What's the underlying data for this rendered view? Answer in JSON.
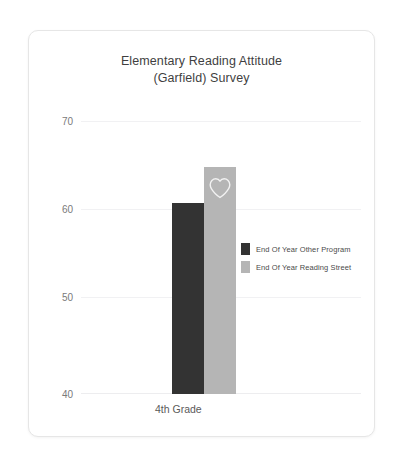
{
  "card": {
    "title_line1": "Elementary Reading Attitude",
    "title_line2": "(Garfield) Survey"
  },
  "colors": {
    "series_other_program": "#333333",
    "series_reading_street": "#b5b5b5",
    "gridline": "#f1f1f3",
    "tick_text": "#7a7a7a",
    "title_text": "#3f3f3f",
    "card_border": "#e6e6e6"
  },
  "icons": {
    "heart": "heart-icon"
  },
  "chart_data": {
    "type": "bar",
    "title": "Elementary Reading Attitude (Garfield) Survey",
    "xlabel": "",
    "ylabel": "",
    "categories": [
      "4th Grade"
    ],
    "series": [
      {
        "name": "End Of Year Other Program",
        "color": "#333333",
        "values": [
          61
        ]
      },
      {
        "name": "End Of Year Reading Street",
        "color": "#b5b5b5",
        "values": [
          65
        ]
      }
    ],
    "ylim": [
      40,
      70
    ],
    "yticks": [
      40,
      50,
      60,
      70
    ],
    "ytick_labels": [
      "40",
      "50",
      "60",
      "70"
    ],
    "grid": true,
    "legend_position": "center-right"
  },
  "yaxis": {
    "ticks": [
      {
        "label": "70",
        "value": 70
      },
      {
        "label": "60",
        "value": 60
      },
      {
        "label": "50",
        "value": 50
      },
      {
        "label": "40",
        "value": 40
      }
    ]
  },
  "xaxis": {
    "categories": [
      {
        "label": "4th Grade"
      }
    ]
  },
  "legend": {
    "items": [
      {
        "label": "End Of Year Other Program",
        "color": "#333333"
      },
      {
        "label": "End Of Year Reading Street",
        "color": "#b5b5b5"
      }
    ]
  }
}
